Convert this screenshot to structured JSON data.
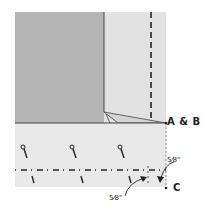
{
  "diagram": {
    "labels": {
      "corner_ab": "A & B",
      "corner_c": "C",
      "seam_allowance_right": "5⁄8\"",
      "seam_allowance_bottom": "5⁄8\""
    },
    "colors": {
      "fabric_dark": "#b4b4b4",
      "fabric_light": "#e2e2e2",
      "fabric_band": "#e8e8e8",
      "line": "#333333",
      "background": "#ffffff"
    },
    "elements": {
      "pins_count": 3,
      "stitch_marks_count": 3
    }
  }
}
